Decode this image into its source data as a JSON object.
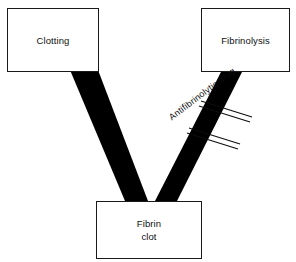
{
  "diagram": {
    "type": "flow-diagram",
    "background_color": "#ffffff",
    "stroke_color": "#1a1a1a",
    "arrow_color": "#000000",
    "nodes": [
      {
        "id": "clotting",
        "label": "Clotting",
        "position": "top-left"
      },
      {
        "id": "fibrinolysis",
        "label": "Fibrinolysis",
        "position": "top-right"
      },
      {
        "id": "fibrin_clot",
        "label": "Fibrin\nclot",
        "label_line_1": "Fibrin",
        "label_line_2": "clot",
        "position": "bottom-center"
      }
    ],
    "arrows": [
      {
        "id": "clotting-to-fibrin-clot",
        "from": "clotting",
        "to": "fibrin_clot",
        "style": "thick-solid-band",
        "direction": "down-right"
      },
      {
        "id": "fibrinolysis-to-fibrin-clot",
        "from": "fibrinolysis",
        "to": "fibrin_clot",
        "style": "thick-solid-band",
        "direction": "down-left",
        "blocked": true
      }
    ],
    "annotations": [
      {
        "id": "antifibrinolytic-drug",
        "label": "Antifibrinolytic drug",
        "rotation_deg": -37,
        "symbol": "double-parallel-inhibition-bars",
        "symbol_count": 2,
        "targets_arrow": "fibrinolysis-to-fibrin-clot"
      }
    ]
  }
}
